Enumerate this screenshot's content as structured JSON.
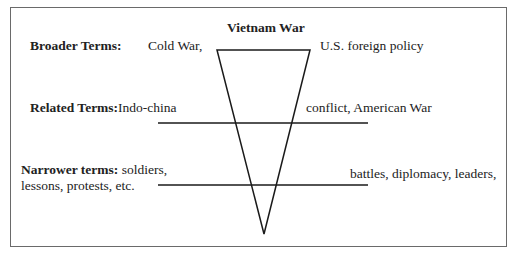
{
  "diagram": {
    "title": "Vietnam War",
    "broader": {
      "label": "Broader Terms:",
      "left": "Cold War,",
      "right": "U.S. foreign policy"
    },
    "related": {
      "label": "Related Terms:",
      "left": "Indo-china",
      "right": "conflict, American War"
    },
    "narrower": {
      "label": "Narrower terms:",
      "left_line1": "soldiers,",
      "left_line2": "lessons, protests, etc.",
      "right": "battles, diplomacy, leaders,"
    },
    "colors": {
      "line": "#1a1a1a",
      "frame": "#6a6a6a",
      "text": "#222222"
    }
  }
}
